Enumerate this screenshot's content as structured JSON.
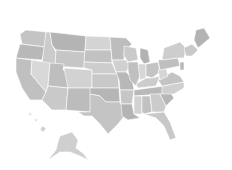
{
  "map": {
    "title": "United States",
    "style": "grayscale choropleth",
    "background": "#ffffff",
    "watermark_text": "",
    "states": [
      {
        "id": "WA",
        "fill": "#c4c4c4",
        "points": "26,30 46,32 45,47 22,44 20,34"
      },
      {
        "id": "OR",
        "fill": "#b8b8b8",
        "points": "20,44 45,47 42,60 16,58"
      },
      {
        "id": "CA",
        "fill": "#c0c0c0",
        "points": "16,58 32,60 31,74 46,92 42,100 30,100 22,88 16,72"
      },
      {
        "id": "ID",
        "fill": "#cbcbcb",
        "points": "46,32 50,32 52,45 56,52 55,66 42,64 44,47"
      },
      {
        "id": "NV",
        "fill": "#d8d8d8",
        "points": "32,60 50,63 48,86 46,92 31,74"
      },
      {
        "id": "MT",
        "fill": "#b4b4b4",
        "points": "50,32 86,36 85,52 56,50 52,45"
      },
      {
        "id": "WY",
        "fill": "#c6c6c6",
        "points": "56,50 85,52 84,68 55,66"
      },
      {
        "id": "UT",
        "fill": "#bebebe",
        "points": "50,63 64,64 63,70 70,70 68,88 48,86"
      },
      {
        "id": "AZ",
        "fill": "#c9c9c9",
        "points": "48,86 68,88 66,110 52,110 42,100 46,92"
      },
      {
        "id": "CO",
        "fill": "#d2d2d2",
        "points": "64,68 92,70 92,88 68,88"
      },
      {
        "id": "NM",
        "fill": "#bcbcbc",
        "points": "68,88 92,88 90,112 66,110"
      },
      {
        "id": "ND",
        "fill": "#d4d4d4",
        "points": "86,36 110,37 111,50 85,50"
      },
      {
        "id": "SD",
        "fill": "#c2c2c2",
        "points": "85,50 111,50 112,63 84,62"
      },
      {
        "id": "NE",
        "fill": "#cdcdcd",
        "points": "84,62 112,63 117,74 92,74 92,70 84,68"
      },
      {
        "id": "KS",
        "fill": "#c8c8c8",
        "points": "92,74 118,74 119,88 92,88"
      },
      {
        "id": "OK",
        "fill": "#b6b6b6",
        "points": "90,88 119,88 120,102 106,102 100,96 90,94"
      },
      {
        "id": "TX",
        "fill": "#c4c4c4",
        "points": "90,94 100,96 106,102 120,102 126,114 118,124 108,134 100,124 92,116 84,116 78,112 90,112"
      },
      {
        "id": "MN",
        "fill": "#bdbdbd",
        "points": "110,37 126,38 132,44 124,52 124,60 112,60"
      },
      {
        "id": "IA",
        "fill": "#d0d0d0",
        "points": "112,60 126,60 130,66 126,72 116,72"
      },
      {
        "id": "MO",
        "fill": "#b8b8b8",
        "points": "116,72 126,72 132,78 134,90 120,90 119,80"
      },
      {
        "id": "AR",
        "fill": "#c6c6c6",
        "points": "120,90 134,90 132,104 121,104"
      },
      {
        "id": "LA",
        "fill": "#b4b4b4",
        "points": "121,104 132,104 134,114 140,118 128,120 122,116"
      },
      {
        "id": "WI",
        "fill": "#cacaca",
        "points": "124,46 136,48 138,60 128,62 124,56"
      },
      {
        "id": "IL",
        "fill": "#c0c0c0",
        "points": "128,62 138,62 140,76 136,86 130,80 128,70"
      },
      {
        "id": "MI",
        "fill": "#b2b2b2",
        "points": "140,48 148,50 150,62 144,64 140,58"
      },
      {
        "id": "IN",
        "fill": "#d6d6d6",
        "points": "138,64 146,64 146,78 140,80"
      },
      {
        "id": "OH",
        "fill": "#c4c4c4",
        "points": "146,64 158,62 160,72 152,78 146,76"
      },
      {
        "id": "KY",
        "fill": "#cccccc",
        "points": "136,84 146,78 152,78 160,76 156,86 138,88"
      },
      {
        "id": "TN",
        "fill": "#b9b9b9",
        "points": "134,90 164,86 162,94 134,96"
      },
      {
        "id": "MS",
        "fill": "#d2d2d2",
        "points": "134,96 142,96 142,114 134,114"
      },
      {
        "id": "AL",
        "fill": "#c1c1c1",
        "points": "142,96 150,96 152,112 144,114 142,112"
      },
      {
        "id": "GA",
        "fill": "#cbcbcb",
        "points": "150,94 160,94 166,106 164,112 152,112"
      },
      {
        "id": "FL",
        "fill": "#c8c8c8",
        "points": "144,114 164,112 170,122 176,138 170,140 164,126 156,118"
      },
      {
        "id": "SC",
        "fill": "#b6b6b6",
        "points": "160,94 170,92 174,98 166,106"
      },
      {
        "id": "NC",
        "fill": "#cfcfcf",
        "points": "162,86 184,82 184,88 174,94 162,94"
      },
      {
        "id": "VA",
        "fill": "#c3c3c3",
        "points": "158,80 172,72 180,76 184,82 162,86"
      },
      {
        "id": "WV",
        "fill": "#d5d5d5",
        "points": "158,70 166,68 168,76 160,80"
      },
      {
        "id": "PA",
        "fill": "#bfbfbf",
        "points": "158,60 178,58 180,66 160,70"
      },
      {
        "id": "NY",
        "fill": "#cdcdcd",
        "points": "164,48 180,42 186,48 184,58 178,58 162,60"
      },
      {
        "id": "NJ",
        "fill": "#b7b7b7",
        "points": "180,62 184,62 184,70 180,70"
      },
      {
        "id": "NE-states",
        "fill": "#c9c9c9",
        "points": "184,48 192,44 198,50 192,56 186,56"
      },
      {
        "id": "ME",
        "fill": "#b3b3b3",
        "points": "196,30 204,28 210,38 198,48 194,40"
      },
      {
        "id": "AK",
        "fill": "#cfcfcf",
        "points": "60,136 72,132 78,140 76,148 84,154 88,160 80,156 70,152 60,152 48,160 56,150 58,142"
      },
      {
        "id": "HI1",
        "fill": "#d6d6d6",
        "points": "28,112 32,114 30,116"
      },
      {
        "id": "HI2",
        "fill": "#d6d6d6",
        "points": "34,118 38,120 36,122"
      },
      {
        "id": "HI3",
        "fill": "#d0d0d0",
        "points": "42,126 46,128 44,132 40,130"
      }
    ]
  }
}
